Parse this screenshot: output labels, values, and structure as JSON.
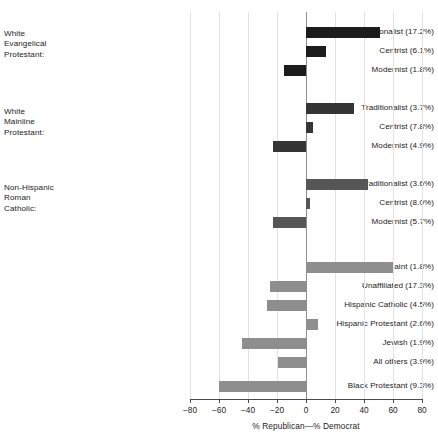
{
  "chart_data": {
    "type": "bar",
    "orientation": "horizontal",
    "title": "",
    "xlabel": "% Republican—% Democrat",
    "ylabel": "",
    "xlim": [
      -80,
      80
    ],
    "xticks": [
      -80,
      -60,
      -40,
      -20,
      0,
      20,
      40,
      60,
      80
    ],
    "xticklabels": [
      "−80",
      "−60",
      "−40",
      "−20",
      "0",
      "20",
      "40",
      "60",
      "80"
    ],
    "grid": true,
    "legend": false,
    "group_headers": [
      {
        "text": "White\nEvangelical\nProtestant:"
      },
      {
        "text": "White\nMainline\nProtestant:"
      },
      {
        "text": "Non-Hispanic\nRoman\nCatholic:"
      }
    ],
    "categories": [
      "Traditionalist (17.2%)",
      "Centrist (6.1%)",
      "Modernist (1.8%)",
      "Traditionalist (3.7%)",
      "Centrist (7.8%)",
      "Modernist (4.9%)",
      "Traditionalist (3.6%)",
      "Centrist (8.0%)",
      "Modernist (5.7%)",
      "Latter-Day Saint (1.8%)",
      "Unaffiliated (17.3%)",
      "Hispanic Catholic (4.5%)",
      "Hispanic Protestant (2.6%)",
      "Jewish (1.9%)",
      "All others (3.9%)",
      "Black Protestant (9.3%)"
    ],
    "values": [
      51,
      14,
      -15,
      33,
      5,
      -23,
      43,
      3,
      -23,
      60,
      -25,
      -27,
      8,
      -44,
      -19,
      -60
    ],
    "bar_colors": [
      "#1c1c1c",
      "#1c1c1c",
      "#1c1c1c",
      "#353535",
      "#353535",
      "#353535",
      "#565656",
      "#565656",
      "#565656",
      "#8e8e8e",
      "#8e8e8e",
      "#8e8e8e",
      "#8e8e8e",
      "#8e8e8e",
      "#8e8e8e",
      "#8e8e8e"
    ]
  }
}
